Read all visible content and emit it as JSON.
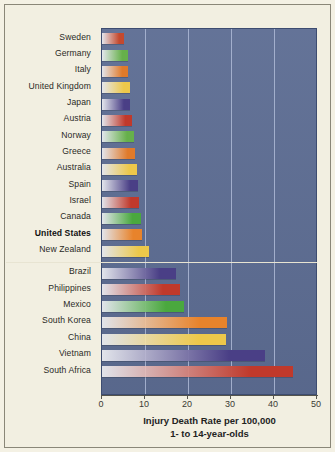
{
  "chart_data": {
    "type": "bar",
    "orientation": "horizontal",
    "title": "",
    "xlabel": "Injury Death Rate per 100,000",
    "xlabel_line2": "1- to 14-year-olds",
    "ylabel": "",
    "xlim": [
      0,
      50
    ],
    "xticks": [
      0,
      10,
      20,
      30,
      40,
      50
    ],
    "xticklabels": [
      "0",
      "10",
      "20",
      "30",
      "40",
      "50"
    ],
    "grid": "vertical",
    "legend": "none",
    "highlight": "United States",
    "group_separator_after": "New Zealand",
    "categories": [
      "Sweden",
      "Germany",
      "Italy",
      "United Kingdom",
      "Japan",
      "Austria",
      "Norway",
      "Greece",
      "Australia",
      "Spain",
      "Israel",
      "Canada",
      "United States",
      "New Zealand",
      "Brazil",
      "Philippines",
      "Mexico",
      "South Korea",
      "China",
      "Vietnam",
      "South Africa"
    ],
    "values": [
      5.2,
      6.0,
      6.1,
      6.4,
      6.6,
      7.0,
      7.5,
      7.7,
      8.1,
      8.3,
      8.5,
      9.0,
      9.2,
      10.9,
      17.2,
      18.1,
      19.0,
      29.1,
      28.8,
      38.0,
      44.4
    ],
    "bar_colors": [
      "#c4492e",
      "#66b04a",
      "#e07a2a",
      "#edc84a",
      "#4a3f86",
      "#c0392b",
      "#66b04a",
      "#e07a2a",
      "#edc84a",
      "#4a3f86",
      "#c0392b",
      "#4aa83e",
      "#e8832b",
      "#edc84a",
      "#4a3f86",
      "#c0392b",
      "#4aa83e",
      "#e8832b",
      "#edc84a",
      "#4a3f86",
      "#c0392b"
    ],
    "plot_background": "#5d6d93",
    "page_background": "#f2efe1",
    "gridline_color": "#aebad6"
  }
}
